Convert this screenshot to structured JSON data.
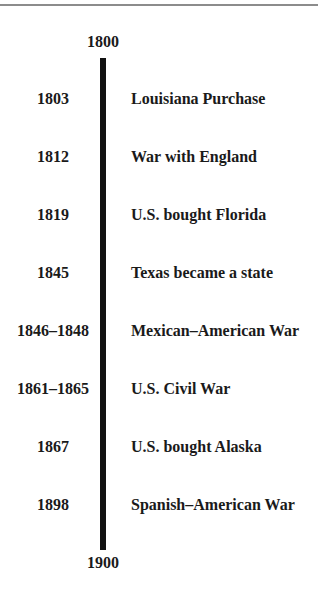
{
  "timeline": {
    "start_label": "1800",
    "end_label": "1900",
    "events": [
      {
        "date": "1803",
        "event": "Louisiana Purchase"
      },
      {
        "date": "1812",
        "event": "War with England"
      },
      {
        "date": "1819",
        "event": "U.S. bought Florida"
      },
      {
        "date": "1845",
        "event": "Texas became a state"
      },
      {
        "date": "1846–1848",
        "event": "Mexican–American War"
      },
      {
        "date": "1861–1865",
        "event": "U.S. Civil War"
      },
      {
        "date": "1867",
        "event": "U.S. bought Alaska"
      },
      {
        "date": "1898",
        "event": "Spanish–American War"
      }
    ]
  },
  "colors": {
    "bar": "#111111",
    "text": "#1a1a1a",
    "top_rule": "#8c8c8c",
    "background": "#ffffff"
  }
}
